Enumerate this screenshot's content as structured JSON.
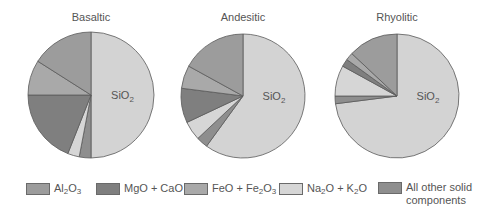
{
  "chart_data": [
    {
      "type": "pie",
      "title": "Basaltic",
      "start_angle": 0,
      "direction": "clockwise",
      "slices": [
        {
          "label": "SiO2",
          "value": 50
        },
        {
          "label": "All other solid components",
          "value": 3
        },
        {
          "label": "Na2O + K2O",
          "value": 3
        },
        {
          "label": "MgO + CaO",
          "value": 19
        },
        {
          "label": "FeO + Fe2O3",
          "value": 9
        },
        {
          "label": "Al2O3",
          "value": 16
        }
      ],
      "slice_label": "SiO2"
    },
    {
      "type": "pie",
      "title": "Andesitic",
      "start_angle": 0,
      "direction": "clockwise",
      "slices": [
        {
          "label": "SiO2",
          "value": 60
        },
        {
          "label": "All other solid components",
          "value": 3
        },
        {
          "label": "Na2O + K2O",
          "value": 5
        },
        {
          "label": "MgO + CaO",
          "value": 9
        },
        {
          "label": "FeO + Fe2O3",
          "value": 6
        },
        {
          "label": "Al2O3",
          "value": 17
        }
      ],
      "slice_label": "SiO2"
    },
    {
      "type": "pie",
      "title": "Rhyolitic",
      "start_angle": 0,
      "direction": "clockwise",
      "slices": [
        {
          "label": "SiO2",
          "value": 73
        },
        {
          "label": "All other solid components",
          "value": 2
        },
        {
          "label": "Na2O + K2O",
          "value": 8
        },
        {
          "label": "MgO + CaO",
          "value": 2
        },
        {
          "label": "FeO + Fe2O3",
          "value": 2
        },
        {
          "label": "Al2O3",
          "value": 13
        }
      ],
      "slice_label": "SiO2"
    }
  ],
  "colors": {
    "SiO2": "#d3d3d3",
    "Al2O3": "#9c9c9c",
    "MgO + CaO": "#7f7f7f",
    "FeO + Fe2O3": "#a9a9a9",
    "Na2O + K2O": "#d6d6d6",
    "All other solid components": "#8e8e8e",
    "outline": "#5a5a5a"
  },
  "legend": [
    {
      "key": "Al2O3",
      "html": "Al<sub>2</sub>O<sub>3</sub>"
    },
    {
      "key": "MgO + CaO",
      "html": "MgO + CaO"
    },
    {
      "key": "FeO + Fe2O3",
      "html": "FeO + Fe<sub>2</sub>O<sub>3</sub>"
    },
    {
      "key": "Na2O + K2O",
      "html": "Na<sub>2</sub>O + K<sub>2</sub>O"
    },
    {
      "key": "All other solid components",
      "html": "All other solid<br>components"
    }
  ],
  "titles": {
    "basaltic": "Basaltic",
    "andesitic": "Andesitic",
    "rhyolitic": "Rhyolitic"
  }
}
